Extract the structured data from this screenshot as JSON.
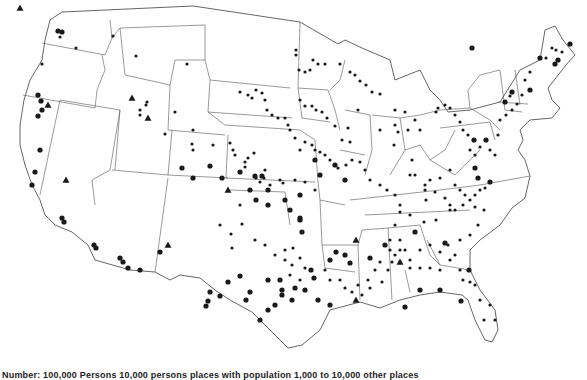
{
  "map": {
    "title": "Cities and places in the conterminous United States",
    "legend_text": "Number: 100,000 Persons   10,000 persons   places with population   1,000 to 10,000   other places",
    "colors": {
      "ink": "#1a1a1a",
      "line": "#555555",
      "background": "#ffffff"
    },
    "symbols": [
      {
        "shape": "large-dot",
        "r": 2.6
      },
      {
        "shape": "small-dot",
        "r": 1.6
      },
      {
        "shape": "triangle",
        "size": 3.5
      }
    ],
    "outline": "M62,12 L193,6 L300,22 L338,44 L345,40 L362,48 L390,60 L395,80 L420,70 L430,90 L440,100 L448,112 L470,110 L500,102 L520,70 L540,60 L545,30 L555,26 L563,40 L575,55 L566,65 L548,88 L552,100 L560,108 L552,118 L530,120 L520,130 L523,140 L518,150 L525,160 L530,176 L525,198 L512,208 L500,225 L480,240 L470,250 L470,270 L480,290 L495,310 L498,330 L492,342 L485,340 L475,320 L468,300 L462,295 L440,292 L420,295 L400,300 L380,308 L360,302 L330,310 L320,330 L302,345 L288,348 L270,330 L252,312 L230,300 L215,290 L200,278 L180,275 L170,280 L155,272 L130,270 L95,260 L88,245 L72,232 L55,225 L45,215 L40,200 L32,185 L25,165 L20,145 L20,125 L24,100 L30,80 L42,60 L45,40 L50,20 Z",
    "state_lines": [
      "M42,43 L105,55 L112,38 L120,28",
      "M23,95 L95,108 L97,90 L105,70 L102,55",
      "M60,100 L40,195",
      "M60,100 L120,110 L110,170 L92,180 L95,205",
      "M120,110 L115,170",
      "M112,38 L110,20",
      "M120,28 L205,25",
      "M120,28 L125,75 L170,85 L175,60 L205,60",
      "M170,85 L168,130 L225,135",
      "M112,170 L168,175 L172,130",
      "M168,175 L228,178",
      "M168,178 L155,272",
      "M228,135 L226,178",
      "M205,25 L205,60 L210,80 L290,88",
      "M210,80 L208,112 L292,118",
      "M208,112 L225,125 L300,130 L315,140",
      "M226,178 L315,182",
      "M230,190 L285,192 L290,225",
      "M300,22 L298,88 L302,118",
      "M298,88 L328,90 L335,110 L340,130",
      "M302,118 L330,122",
      "M315,140 L318,182 L320,200 L345,205",
      "M320,200 L322,245 L358,245 L362,230",
      "M330,90 L340,80 L345,60",
      "M345,110 L370,115 L372,150 L365,175",
      "M372,115 L400,118 L405,150 L390,175",
      "M340,150 L365,155",
      "M322,245 L325,268 L355,272",
      "M358,245 L360,300",
      "M362,230 L388,228 L392,300",
      "M388,228 L420,225 L430,255 L440,265 L470,270",
      "M350,200 L440,190 L480,185 L530,176",
      "M365,215 L470,210",
      "M405,150 L420,145 L430,160 L445,150 L455,130",
      "M430,160 L455,175 L470,160 L480,150",
      "M400,118 L420,115 L440,110",
      "M440,110 L470,108 L490,120 L500,130",
      "M470,108 L468,90 L480,75 L500,70",
      "M500,70 L505,110 L522,112",
      "M515,70 L520,105",
      "M498,102 L528,104",
      "M440,128 L490,122 L495,140",
      "M405,270 L410,292",
      "M427,240 L440,265"
    ],
    "dots_large": [
      [
        58,
        31
      ],
      [
        62,
        32
      ],
      [
        38,
        95
      ],
      [
        41,
        101
      ],
      [
        42,
        110
      ],
      [
        38,
        116
      ],
      [
        40,
        150
      ],
      [
        35,
        172
      ],
      [
        32,
        185
      ],
      [
        62,
        218
      ],
      [
        64,
        222
      ],
      [
        94,
        245
      ],
      [
        96,
        248
      ],
      [
        120,
        258
      ],
      [
        123,
        262
      ],
      [
        128,
        268
      ],
      [
        140,
        270
      ],
      [
        182,
        168
      ],
      [
        193,
        178
      ],
      [
        210,
        166
      ],
      [
        222,
        178
      ],
      [
        240,
        172
      ],
      [
        255,
        176
      ],
      [
        285,
        200
      ],
      [
        290,
        210
      ],
      [
        300,
        195
      ],
      [
        315,
        160
      ],
      [
        300,
        218
      ],
      [
        302,
        232
      ],
      [
        311,
        270
      ],
      [
        314,
        278
      ],
      [
        330,
        260
      ],
      [
        336,
        252
      ],
      [
        345,
        255
      ],
      [
        350,
        263
      ],
      [
        370,
        258
      ],
      [
        385,
        245
      ],
      [
        415,
        232
      ],
      [
        445,
        243
      ],
      [
        469,
        270
      ],
      [
        461,
        301
      ],
      [
        405,
        307
      ],
      [
        420,
        290
      ],
      [
        440,
        290
      ],
      [
        474,
        140
      ],
      [
        486,
        140
      ],
      [
        475,
        168
      ],
      [
        478,
        178
      ],
      [
        490,
        182
      ],
      [
        505,
        102
      ],
      [
        512,
        92
      ],
      [
        530,
        90
      ],
      [
        540,
        58
      ],
      [
        555,
        64
      ],
      [
        558,
        60
      ],
      [
        570,
        44
      ],
      [
        472,
        48
      ],
      [
        300,
        220
      ],
      [
        320,
        175
      ],
      [
        335,
        165
      ],
      [
        345,
        180
      ],
      [
        256,
        200
      ],
      [
        250,
        190
      ],
      [
        262,
        176
      ],
      [
        268,
        190
      ],
      [
        268,
        205
      ],
      [
        292,
        300
      ],
      [
        282,
        290
      ],
      [
        295,
        288
      ],
      [
        318,
        300
      ],
      [
        330,
        305
      ],
      [
        260,
        320
      ],
      [
        268,
        310
      ],
      [
        275,
        305
      ],
      [
        282,
        295
      ],
      [
        305,
        290
      ],
      [
        160,
        252
      ],
      [
        208,
        301
      ],
      [
        206,
        306
      ],
      [
        210,
        292
      ],
      [
        220,
        296
      ],
      [
        228,
        282
      ],
      [
        240,
        276
      ],
      [
        250,
        292
      ],
      [
        246,
        300
      ],
      [
        268,
        280
      ],
      [
        280,
        280
      ]
    ],
    "dots_small": [
      [
        60,
        37
      ],
      [
        76,
        48
      ],
      [
        42,
        64
      ],
      [
        113,
        36
      ],
      [
        136,
        56
      ],
      [
        187,
        64
      ],
      [
        147,
        102
      ],
      [
        140,
        110
      ],
      [
        146,
        105
      ],
      [
        165,
        134
      ],
      [
        175,
        112
      ],
      [
        140,
        115
      ],
      [
        193,
        130
      ],
      [
        192,
        144
      ],
      [
        193,
        150
      ],
      [
        213,
        145
      ],
      [
        230,
        143
      ],
      [
        233,
        150
      ],
      [
        245,
        162
      ],
      [
        235,
        155
      ],
      [
        248,
        158
      ],
      [
        254,
        153
      ],
      [
        245,
        167
      ],
      [
        256,
        178
      ],
      [
        265,
        170
      ],
      [
        260,
        182
      ],
      [
        264,
        178
      ],
      [
        270,
        185
      ],
      [
        280,
        180
      ],
      [
        283,
        183
      ],
      [
        295,
        180
      ],
      [
        305,
        182
      ],
      [
        315,
        190
      ],
      [
        240,
        205
      ],
      [
        242,
        224
      ],
      [
        231,
        234
      ],
      [
        220,
        225
      ],
      [
        232,
        248
      ],
      [
        255,
        240
      ],
      [
        265,
        245
      ],
      [
        275,
        255
      ],
      [
        285,
        250
      ],
      [
        293,
        248
      ],
      [
        300,
        258
      ],
      [
        305,
        268
      ],
      [
        325,
        270
      ],
      [
        330,
        280
      ],
      [
        340,
        280
      ],
      [
        345,
        288
      ],
      [
        358,
        285
      ],
      [
        368,
        280
      ],
      [
        375,
        270
      ],
      [
        380,
        262
      ],
      [
        392,
        262
      ],
      [
        400,
        262
      ],
      [
        410,
        268
      ],
      [
        420,
        250
      ],
      [
        430,
        245
      ],
      [
        440,
        252
      ],
      [
        448,
        245
      ],
      [
        455,
        255
      ],
      [
        460,
        240
      ],
      [
        470,
        235
      ],
      [
        478,
        225
      ],
      [
        484,
        210
      ],
      [
        475,
        207
      ],
      [
        463,
        205
      ],
      [
        450,
        210
      ],
      [
        436,
        220
      ],
      [
        424,
        222
      ],
      [
        410,
        215
      ],
      [
        400,
        212
      ],
      [
        395,
        225
      ],
      [
        400,
        240
      ],
      [
        395,
        255
      ],
      [
        388,
        270
      ],
      [
        382,
        282
      ],
      [
        370,
        288
      ],
      [
        362,
        295
      ],
      [
        352,
        292
      ],
      [
        300,
        280
      ],
      [
        290,
        275
      ],
      [
        292,
        265
      ],
      [
        285,
        260
      ],
      [
        490,
        305
      ],
      [
        495,
        320
      ],
      [
        484,
        320
      ],
      [
        480,
        300
      ],
      [
        475,
        285
      ],
      [
        470,
        282
      ],
      [
        463,
        280
      ],
      [
        460,
        270
      ],
      [
        450,
        260
      ],
      [
        440,
        270
      ],
      [
        430,
        268
      ],
      [
        420,
        268
      ],
      [
        410,
        260
      ],
      [
        405,
        250
      ],
      [
        400,
        250
      ],
      [
        390,
        250
      ],
      [
        390,
        240
      ],
      [
        310,
        70
      ],
      [
        313,
        60
      ],
      [
        296,
        50
      ],
      [
        296,
        55
      ],
      [
        299,
        70
      ],
      [
        305,
        72
      ],
      [
        318,
        64
      ],
      [
        325,
        64
      ],
      [
        340,
        64
      ],
      [
        350,
        72
      ],
      [
        355,
        75
      ],
      [
        360,
        81
      ],
      [
        366,
        85
      ],
      [
        372,
        92
      ],
      [
        380,
        94
      ],
      [
        395,
        110
      ],
      [
        395,
        125
      ],
      [
        398,
        132
      ],
      [
        408,
        130
      ],
      [
        405,
        112
      ],
      [
        415,
        120
      ],
      [
        420,
        130
      ],
      [
        436,
        112
      ],
      [
        438,
        108
      ],
      [
        445,
        105
      ],
      [
        450,
        108
      ],
      [
        455,
        115
      ],
      [
        460,
        122
      ],
      [
        463,
        130
      ],
      [
        468,
        135
      ],
      [
        470,
        150
      ],
      [
        475,
        155
      ],
      [
        480,
        147
      ],
      [
        490,
        150
      ],
      [
        495,
        155
      ],
      [
        498,
        135
      ],
      [
        500,
        120
      ],
      [
        506,
        115
      ],
      [
        512,
        110
      ],
      [
        517,
        104
      ],
      [
        510,
        96
      ],
      [
        522,
        95
      ],
      [
        530,
        72
      ],
      [
        525,
        80
      ],
      [
        546,
        58
      ],
      [
        552,
        48
      ],
      [
        556,
        50
      ],
      [
        562,
        52
      ],
      [
        358,
        110
      ],
      [
        380,
        130
      ],
      [
        394,
        145
      ],
      [
        412,
        160
      ],
      [
        410,
        175
      ],
      [
        415,
        175
      ],
      [
        425,
        185
      ],
      [
        435,
        192
      ],
      [
        426,
        200
      ],
      [
        400,
        205
      ],
      [
        395,
        195
      ],
      [
        387,
        190
      ],
      [
        380,
        185
      ],
      [
        370,
        180
      ],
      [
        365,
        170
      ],
      [
        360,
        162
      ],
      [
        352,
        160
      ],
      [
        346,
        165
      ],
      [
        338,
        168
      ],
      [
        330,
        160
      ],
      [
        325,
        155
      ],
      [
        320,
        152
      ],
      [
        315,
        150
      ],
      [
        312,
        145
      ],
      [
        305,
        142
      ],
      [
        300,
        150
      ],
      [
        295,
        138
      ],
      [
        290,
        130
      ],
      [
        288,
        125
      ],
      [
        285,
        118
      ],
      [
        278,
        118
      ],
      [
        272,
        115
      ],
      [
        267,
        110
      ],
      [
        265,
        100
      ],
      [
        262,
        93
      ],
      [
        256,
        90
      ],
      [
        252,
        98
      ],
      [
        248,
        95
      ],
      [
        240,
        92
      ],
      [
        342,
        140
      ],
      [
        350,
        142
      ],
      [
        348,
        128
      ],
      [
        335,
        126
      ],
      [
        327,
        118
      ],
      [
        322,
        112
      ],
      [
        316,
        110
      ],
      [
        312,
        106
      ],
      [
        305,
        106
      ],
      [
        300,
        100
      ],
      [
        450,
        170
      ],
      [
        455,
        185
      ],
      [
        460,
        190
      ],
      [
        465,
        195
      ],
      [
        470,
        200
      ],
      [
        475,
        195
      ],
      [
        480,
        190
      ],
      [
        485,
        188
      ],
      [
        440,
        178
      ],
      [
        430,
        180
      ],
      [
        425,
        190
      ],
      [
        445,
        198
      ],
      [
        450,
        205
      ],
      [
        455,
        210
      ]
    ],
    "triangles": [
      [
        20,
        8
      ],
      [
        48,
        105
      ],
      [
        132,
        98
      ],
      [
        66,
        180
      ],
      [
        148,
        118
      ],
      [
        228,
        190
      ],
      [
        168,
        245
      ],
      [
        356,
        240
      ],
      [
        356,
        300
      ],
      [
        400,
        262
      ]
    ]
  }
}
